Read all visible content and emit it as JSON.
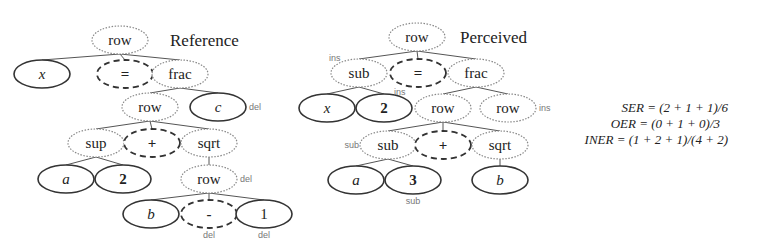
{
  "reference": {
    "title": "Reference",
    "nodes": [
      {
        "id": "r_row0",
        "label": "row",
        "style": "dotted",
        "x": 120,
        "y": 40
      },
      {
        "id": "r_x",
        "label": "x",
        "style": "solid",
        "x": 42,
        "y": 74,
        "italic": true
      },
      {
        "id": "r_eq",
        "label": "=",
        "style": "dashed",
        "x": 125,
        "y": 74,
        "bold": true
      },
      {
        "id": "r_frac",
        "label": "frac",
        "style": "dotted",
        "x": 180,
        "y": 74
      },
      {
        "id": "r_row1",
        "label": "row",
        "style": "dotted",
        "x": 150,
        "y": 107
      },
      {
        "id": "r_c",
        "label": "c",
        "style": "solid",
        "x": 218,
        "y": 107,
        "italic": true,
        "annotation": "del"
      },
      {
        "id": "r_sup",
        "label": "sup",
        "style": "dotted",
        "x": 96,
        "y": 143
      },
      {
        "id": "r_plus",
        "label": "+",
        "style": "dashed",
        "x": 152,
        "y": 143,
        "bold": true
      },
      {
        "id": "r_sqrt",
        "label": "sqrt",
        "style": "dotted",
        "x": 209,
        "y": 143
      },
      {
        "id": "r_a",
        "label": "a",
        "style": "solid",
        "x": 66,
        "y": 179,
        "italic": true
      },
      {
        "id": "r_2",
        "label": "2",
        "style": "solid",
        "x": 123,
        "y": 179,
        "bold": true
      },
      {
        "id": "r_row2",
        "label": "row",
        "style": "dotted",
        "x": 209,
        "y": 179,
        "annotation": "del"
      },
      {
        "id": "r_b",
        "label": "b",
        "style": "solid",
        "x": 151,
        "y": 214,
        "italic": true
      },
      {
        "id": "r_minus",
        "label": "-",
        "style": "dashed",
        "x": 209,
        "y": 214,
        "bold": true,
        "annotation": "del"
      },
      {
        "id": "r_1",
        "label": "1",
        "style": "solid",
        "x": 264,
        "y": 214,
        "annotation": "del"
      }
    ],
    "edges": [
      [
        "r_row0",
        "r_x"
      ],
      [
        "r_row0",
        "r_eq"
      ],
      [
        "r_row0",
        "r_frac"
      ],
      [
        "r_frac",
        "r_row1"
      ],
      [
        "r_frac",
        "r_c"
      ],
      [
        "r_row1",
        "r_sup"
      ],
      [
        "r_row1",
        "r_plus"
      ],
      [
        "r_row1",
        "r_sqrt"
      ],
      [
        "r_sup",
        "r_a"
      ],
      [
        "r_sup",
        "r_2"
      ],
      [
        "r_sqrt",
        "r_row2"
      ],
      [
        "r_row2",
        "r_b"
      ],
      [
        "r_row2",
        "r_minus"
      ],
      [
        "r_row2",
        "r_1"
      ]
    ]
  },
  "perceived": {
    "title": "Perceived",
    "nodes": [
      {
        "id": "p_row0",
        "label": "row",
        "style": "dotted",
        "x": 417,
        "y": 37
      },
      {
        "id": "p_sub0",
        "label": "sub",
        "style": "dotted",
        "x": 359,
        "y": 73,
        "annotation": "ins"
      },
      {
        "id": "p_eq",
        "label": "=",
        "style": "dashed",
        "x": 418,
        "y": 73,
        "bold": true
      },
      {
        "id": "p_frac",
        "label": "frac",
        "style": "dotted",
        "x": 476,
        "y": 73
      },
      {
        "id": "p_x",
        "label": "x",
        "style": "solid",
        "x": 327,
        "y": 108,
        "italic": true
      },
      {
        "id": "p_2",
        "label": "2",
        "style": "solid",
        "x": 384,
        "y": 108,
        "bold": true,
        "annotation": "ins"
      },
      {
        "id": "p_row1",
        "label": "row",
        "style": "dotted",
        "x": 443,
        "y": 108
      },
      {
        "id": "p_row_ins",
        "label": "row",
        "style": "dotted",
        "x": 508,
        "y": 108,
        "annotation": "ins"
      },
      {
        "id": "p_sub1",
        "label": "sub",
        "style": "dotted",
        "x": 388,
        "y": 145,
        "annotation": "sub"
      },
      {
        "id": "p_plus",
        "label": "+",
        "style": "dashed",
        "x": 443,
        "y": 145,
        "bold": true
      },
      {
        "id": "p_sqrt",
        "label": "sqrt",
        "style": "dotted",
        "x": 500,
        "y": 145
      },
      {
        "id": "p_a",
        "label": "a",
        "style": "solid",
        "x": 356,
        "y": 180,
        "italic": true
      },
      {
        "id": "p_3",
        "label": "3",
        "style": "solid",
        "x": 413,
        "y": 180,
        "bold": true,
        "annotation": "sub"
      },
      {
        "id": "p_b",
        "label": "b",
        "style": "solid",
        "x": 500,
        "y": 180,
        "italic": true
      }
    ],
    "edges": [
      [
        "p_row0",
        "p_sub0"
      ],
      [
        "p_row0",
        "p_eq"
      ],
      [
        "p_row0",
        "p_frac"
      ],
      [
        "p_sub0",
        "p_x"
      ],
      [
        "p_sub0",
        "p_2"
      ],
      [
        "p_frac",
        "p_row1"
      ],
      [
        "p_frac",
        "p_row_ins"
      ],
      [
        "p_row1",
        "p_sub1"
      ],
      [
        "p_row1",
        "p_plus"
      ],
      [
        "p_row1",
        "p_sqrt"
      ],
      [
        "p_sub1",
        "p_a"
      ],
      [
        "p_sub1",
        "p_3"
      ],
      [
        "p_sqrt",
        "p_b"
      ]
    ]
  },
  "metrics": [
    {
      "name": "SER",
      "formula": "SER = (2 + 1 + 1)/6"
    },
    {
      "name": "OER",
      "formula": "OER = (0 + 1 + 0)/3"
    },
    {
      "name": "INER",
      "formula": "INER = (1 + 2 + 1)/(4 + 2)"
    }
  ],
  "colors": {
    "text": "#222222",
    "edge": "#555555",
    "solid_border": "#333333",
    "dotted_border": "#888888",
    "dashed_border": "#333333",
    "annotation": "#777777"
  }
}
